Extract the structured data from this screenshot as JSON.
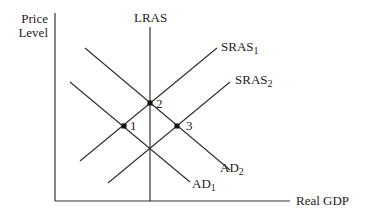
{
  "diagram": {
    "y_axis_label_line1": "Price",
    "y_axis_label_line2": "Level",
    "x_axis_label": "Real GDP",
    "curves": {
      "lras": {
        "label": "LRAS"
      },
      "sras1": {
        "label": "SRAS",
        "sub": "1"
      },
      "sras2": {
        "label": "SRAS",
        "sub": "2"
      },
      "ad1": {
        "label": "AD",
        "sub": "1"
      },
      "ad2": {
        "label": "AD",
        "sub": "2"
      }
    },
    "points": [
      {
        "label": "1"
      },
      {
        "label": "2"
      },
      {
        "label": "3"
      }
    ],
    "line_color": "#333333"
  }
}
